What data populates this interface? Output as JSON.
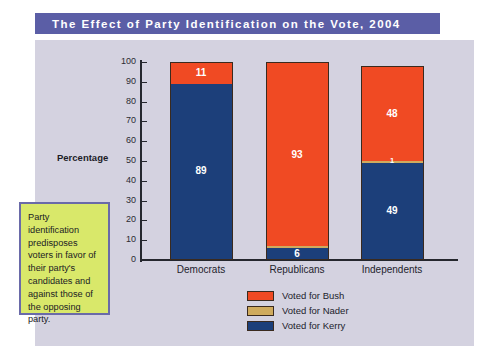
{
  "title": "The Effect of Party Identification on the Vote, 2004",
  "axis_title": "Percentage",
  "annotation": "Party identification predisposes voters in favor of their party's candidates and against those of the opposing party.",
  "colors": {
    "title_bar": "#5b5ea6",
    "panel": "#d4d2e0",
    "bush": "#f04a23",
    "nader": "#cfab5e",
    "kerry": "#1c3f7a",
    "callout_fill": "#d9e86a",
    "callout_border": "#6a6aa8",
    "axis": "#25272e"
  },
  "chart_data": {
    "type": "bar",
    "title": "The Effect of Party Identification on the Vote, 2004",
    "xlabel": "",
    "ylabel": "Percentage",
    "ylim": [
      0,
      100
    ],
    "yticks": [
      0,
      10,
      20,
      30,
      40,
      50,
      60,
      70,
      80,
      90,
      100
    ],
    "ytick_labels": [
      "0",
      "10",
      "20",
      "30",
      "40",
      "50",
      "60",
      "70",
      "80",
      "90",
      "100"
    ],
    "grid": false,
    "stacked": true,
    "legend_position": "bottom-center",
    "categories": [
      "Democrats",
      "Republicans",
      "Independents"
    ],
    "series": [
      {
        "name": "Voted for Bush",
        "color": "#f04a23",
        "values": [
          11,
          93,
          48
        ]
      },
      {
        "name": "Voted for Nader",
        "color": "#cfab5e",
        "values": [
          0,
          1,
          1
        ]
      },
      {
        "name": "Voted for Kerry",
        "color": "#1c3f7a",
        "values": [
          89,
          6,
          49
        ]
      }
    ],
    "data_labels": {
      "Democrats": [
        {
          "series": "Voted for Bush",
          "label": "11"
        },
        {
          "series": "Voted for Kerry",
          "label": "89"
        }
      ],
      "Republicans": [
        {
          "series": "Voted for Bush",
          "label": "93"
        },
        {
          "series": "Voted for Kerry",
          "label": "6"
        }
      ],
      "Independents": [
        {
          "series": "Voted for Bush",
          "label": "48"
        },
        {
          "series": "Voted for Nader",
          "label": "1"
        },
        {
          "series": "Voted for Kerry",
          "label": "49"
        }
      ]
    }
  },
  "legend": [
    {
      "label": "Voted for Bush",
      "color": "#f04a23"
    },
    {
      "label": "Voted for Nader",
      "color": "#cfab5e"
    },
    {
      "label": "Voted for Kerry",
      "color": "#1c3f7a"
    }
  ]
}
